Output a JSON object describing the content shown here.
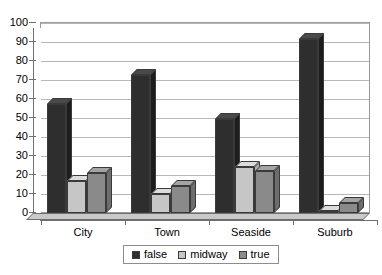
{
  "chart_data": {
    "type": "bar",
    "title": "",
    "subtitle": "",
    "xlabel": "",
    "ylabel": "",
    "categories": [
      "City",
      "Town",
      "Seaside",
      "Suburb"
    ],
    "series": [
      {
        "name": "false",
        "color": "#2e2e2e",
        "values": [
          57,
          72,
          49,
          91
        ]
      },
      {
        "name": "midway",
        "color": "#c6c6c6",
        "values": [
          17,
          10,
          24,
          1
        ]
      },
      {
        "name": "true",
        "color": "#8a8a8a",
        "values": [
          21,
          14,
          22,
          5
        ]
      }
    ],
    "ylim": [
      0,
      100
    ],
    "y_ticks": [
      0,
      10,
      20,
      30,
      40,
      50,
      60,
      70,
      80,
      90,
      100
    ],
    "y_tick_labels": [
      "0",
      "10",
      "20",
      "30",
      "40",
      "50",
      "60",
      "70",
      "80",
      "90",
      "100"
    ],
    "grid": true,
    "grid_axis": "y",
    "legend_position": "bottom",
    "style": "3d-column",
    "background_color": "#ffffff",
    "gridline_color": "#b7b7b7",
    "axis_color": "#6f6f6f"
  },
  "legend": {
    "items": [
      {
        "label": "false"
      },
      {
        "label": "midway"
      },
      {
        "label": "true"
      }
    ]
  }
}
